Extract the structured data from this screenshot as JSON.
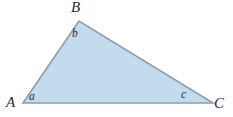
{
  "figure": {
    "type": "geometry-diagram",
    "shape": "triangle",
    "background_color": "#ffffff",
    "fill_color": "#c3dced",
    "stroke_color": "#8c9cad",
    "label_color": "#1b2a3b",
    "width": 233,
    "height": 117
  },
  "vertices": [
    {
      "name": "A",
      "label": "A",
      "x": 23,
      "y": 103
    },
    {
      "name": "B",
      "label": "B",
      "x": 79,
      "y": 21
    },
    {
      "name": "C",
      "label": "C",
      "x": 213,
      "y": 103
    }
  ],
  "angles": [
    {
      "name": "a",
      "label": "a",
      "at_vertex": "A"
    },
    {
      "name": "b",
      "label": "b",
      "at_vertex": "B"
    },
    {
      "name": "c",
      "label": "c",
      "at_vertex": "C"
    }
  ],
  "polygon": {
    "points": "23,103 79,21 213,103"
  },
  "edges": [
    {
      "name": "AB",
      "from": "A",
      "to": "B"
    },
    {
      "name": "BC",
      "from": "B",
      "to": "C"
    },
    {
      "name": "AC",
      "from": "A",
      "to": "C"
    }
  ]
}
